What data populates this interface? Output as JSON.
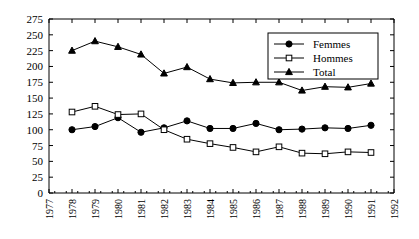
{
  "chart_data": {
    "type": "line",
    "title": "",
    "subtitle": "",
    "xlabel": "",
    "ylabel": "",
    "xlim": [
      1977,
      1992
    ],
    "ylim": [
      0,
      275
    ],
    "ytick_step": 25,
    "grid": false,
    "legend_position": "top-right",
    "categories": [
      1978,
      1979,
      1980,
      1981,
      1982,
      1983,
      1984,
      1985,
      1986,
      1987,
      1988,
      1989,
      1990,
      1991
    ],
    "xticks": [
      "1977",
      "1978",
      "1979",
      "1980",
      "1981",
      "1982",
      "1983",
      "1984",
      "1985",
      "1986",
      "1987",
      "1988",
      "1989",
      "1990",
      "1991",
      "1992"
    ],
    "yticks": [
      "0",
      "25",
      "50",
      "75",
      "100",
      "125",
      "150",
      "175",
      "200",
      "225",
      "250",
      "275"
    ],
    "series": [
      {
        "name": "Femmes",
        "marker": "filled-circle",
        "values": [
          100,
          105,
          119,
          96,
          103,
          114,
          102,
          102,
          110,
          100,
          101,
          103,
          102,
          107
        ]
      },
      {
        "name": "Hommes",
        "marker": "open-square",
        "values": [
          128,
          137,
          124,
          125,
          100,
          85,
          78,
          72,
          65,
          73,
          63,
          62,
          65,
          64
        ]
      },
      {
        "name": "Total",
        "marker": "filled-triangle",
        "values": [
          225,
          240,
          231,
          219,
          189,
          199,
          180,
          174,
          175,
          175,
          162,
          168,
          167,
          173
        ]
      }
    ]
  },
  "legend": {
    "items": [
      {
        "label": "Femmes"
      },
      {
        "label": "Hommes"
      },
      {
        "label": "Total"
      }
    ]
  },
  "colors": {
    "axis": "#000000",
    "line": "#000000",
    "background": "#ffffff"
  }
}
